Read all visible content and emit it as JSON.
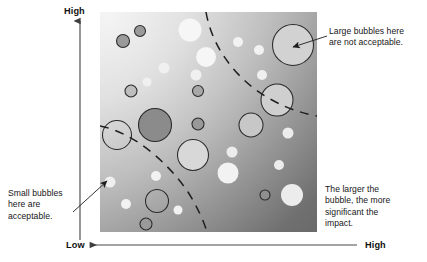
{
  "figure": {
    "axes": {
      "vertical_top_label": "High",
      "horizontal_left_label": "Low",
      "horizontal_right_label": "High"
    },
    "annotations": {
      "large_bubbles": "Large bubbles here\nare not acceptable.",
      "small_bubbles": "Small bubbles\nhere are\nacceptable.",
      "legend_note": "The larger the\nbubble, the more\nsignificant the\nimpact."
    }
  },
  "colors": {
    "plot_light": "#f2f2f2",
    "plot_dark": "#6b6b6b",
    "bubble_white": "#f4f4f4",
    "bubble_light": "#d4d4d4",
    "bubble_mid": "#a8a8a8",
    "bubble_dark": "#8a8a8a",
    "outline": "#2a2a2a",
    "axis": "#4a4a4a",
    "text": "#161616"
  },
  "chart_data": {
    "type": "scatter",
    "xlabel": "",
    "ylabel": "",
    "xlim": [
      0,
      100
    ],
    "ylim": [
      0,
      100
    ],
    "grid": false,
    "legend": "none",
    "x_tick_labels": [
      "Low",
      "High"
    ],
    "y_tick_labels": [
      "High"
    ],
    "note": "Bubble size encodes impact significance; position encodes acceptability region.",
    "plot_rect_px": {
      "x": 100,
      "y": 12,
      "width": 217,
      "height": 220
    },
    "threshold_curves": [
      {
        "name": "inner-acceptability-boundary",
        "style": "dashed",
        "path_px": "M 100,126 C 132,132 166,160 188,192 C 198,208 204,222 207,232"
      },
      {
        "name": "outer-acceptability-boundary",
        "style": "dashed",
        "path_px": "M 206,12 C 212,48 238,82 272,100 C 290,110 306,114 317,116"
      }
    ],
    "bubbles": [
      {
        "cx": 123,
        "cy": 41,
        "r": 6.5,
        "fill": "#9a9a9a",
        "stroke": "#2a2a2a"
      },
      {
        "cx": 140,
        "cy": 31,
        "r": 5.5,
        "fill": "#9a9a9a",
        "stroke": "#2a2a2a"
      },
      {
        "cx": 190,
        "cy": 30,
        "r": 11.5,
        "fill": "#f6f6f6",
        "stroke": "none"
      },
      {
        "cx": 206,
        "cy": 57,
        "r": 10.0,
        "fill": "#f6f6f6",
        "stroke": "none"
      },
      {
        "cx": 238,
        "cy": 42,
        "r": 5.0,
        "fill": "#f2f2f2",
        "stroke": "none"
      },
      {
        "cx": 259,
        "cy": 50,
        "r": 5.0,
        "fill": "#f2f2f2",
        "stroke": "none"
      },
      {
        "cx": 293,
        "cy": 45,
        "r": 20.5,
        "fill": "#d2d2d2",
        "stroke": "#2a2a2a"
      },
      {
        "cx": 164,
        "cy": 68,
        "r": 5.5,
        "fill": "#f0f0f0",
        "stroke": "none"
      },
      {
        "cx": 147,
        "cy": 82,
        "r": 4.5,
        "fill": "#f0f0f0",
        "stroke": "none"
      },
      {
        "cx": 131,
        "cy": 91,
        "r": 6.0,
        "fill": "#bdbdbd",
        "stroke": "#2a2a2a"
      },
      {
        "cx": 196,
        "cy": 75,
        "r": 5.5,
        "fill": "#f0f0f0",
        "stroke": "none"
      },
      {
        "cx": 262,
        "cy": 75,
        "r": 5.0,
        "fill": "#f0f0f0",
        "stroke": "none"
      },
      {
        "cx": 198,
        "cy": 91,
        "r": 5.5,
        "fill": "#a8a8a8",
        "stroke": "#2a2a2a"
      },
      {
        "cx": 277,
        "cy": 100,
        "r": 16.0,
        "fill": "#cfcfcf",
        "stroke": "#2a2a2a"
      },
      {
        "cx": 155,
        "cy": 125,
        "r": 16.5,
        "fill": "#8b8b8b",
        "stroke": "#2a2a2a"
      },
      {
        "cx": 198,
        "cy": 124,
        "r": 6.0,
        "fill": "#999999",
        "stroke": "#2a2a2a"
      },
      {
        "cx": 251,
        "cy": 125,
        "r": 12.0,
        "fill": "#c7c7c7",
        "stroke": "#2a2a2a"
      },
      {
        "cx": 117,
        "cy": 135,
        "r": 14.5,
        "fill": "none",
        "stroke": "#2a2a2a"
      },
      {
        "cx": 288,
        "cy": 133,
        "r": 5.5,
        "fill": "#ececec",
        "stroke": "none"
      },
      {
        "cx": 193,
        "cy": 155,
        "r": 15.5,
        "fill": "#d8d8d8",
        "stroke": "#2a2a2a"
      },
      {
        "cx": 232,
        "cy": 152,
        "r": 5.5,
        "fill": "#ececec",
        "stroke": "none"
      },
      {
        "cx": 279,
        "cy": 165,
        "r": 5.0,
        "fill": "#ececec",
        "stroke": "none"
      },
      {
        "cx": 228,
        "cy": 173,
        "r": 10.5,
        "fill": "#f2f2f2",
        "stroke": "none"
      },
      {
        "cx": 110,
        "cy": 182,
        "r": 5.5,
        "fill": "#efefef",
        "stroke": "none"
      },
      {
        "cx": 156,
        "cy": 176,
        "r": 5.0,
        "fill": "#f2f2f2",
        "stroke": "none"
      },
      {
        "cx": 126,
        "cy": 204,
        "r": 5.0,
        "fill": "#f2f2f2",
        "stroke": "none"
      },
      {
        "cx": 157,
        "cy": 201,
        "r": 11.5,
        "fill": "none",
        "stroke": "#2a2a2a"
      },
      {
        "cx": 178,
        "cy": 210,
        "r": 4.5,
        "fill": "#f2f2f2",
        "stroke": "none"
      },
      {
        "cx": 146,
        "cy": 224,
        "r": 6.0,
        "fill": "#9a9a9a",
        "stroke": "#2a2a2a"
      },
      {
        "cx": 265,
        "cy": 195,
        "r": 5.0,
        "fill": "#8f8f8f",
        "stroke": "#2a2a2a"
      },
      {
        "cx": 292,
        "cy": 195,
        "r": 11.0,
        "fill": "#ececec",
        "stroke": "none"
      }
    ],
    "callouts": [
      {
        "name": "large-bubbles-callout",
        "from_px": [
          327,
          36
        ],
        "to_px": [
          293,
          47
        ],
        "text": "Large bubbles here are not acceptable."
      },
      {
        "name": "small-bubbles-callout",
        "from_px": [
          73,
          212
        ],
        "to_px": [
          107,
          181
        ],
        "text": "Small bubbles here are acceptable."
      }
    ]
  }
}
